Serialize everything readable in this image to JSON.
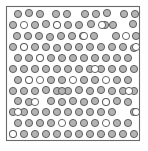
{
  "figure": {
    "width": 148,
    "height": 151,
    "background_color": "#ffffff"
  },
  "frame": {
    "name": "bounding-box",
    "x": 6.5,
    "y": 6.5,
    "width": 133,
    "height": 134,
    "stroke_color": "#6b6b6b",
    "fill_color": "#ffffff",
    "stroke_width": 1.1
  },
  "legend": {
    "filled_label": "filled particle",
    "open_label": "open particle",
    "filled_color": "#b3b3b3",
    "open_color": "#ffffff",
    "outline_color": "#4a4a4a"
  },
  "chart_data": {
    "type": "scatter",
    "title": "",
    "xlabel": "",
    "ylabel": "",
    "xlim": [
      6.5,
      139.5
    ],
    "ylim": [
      6.5,
      140.5
    ],
    "grid": false,
    "legend_position": "none",
    "radius": 3.6,
    "counts": {
      "total": 148,
      "filled": 127,
      "open": 21
    },
    "series": [
      {
        "name": "filled",
        "fill": "#b3b3b3",
        "stroke": "#4a4a4a",
        "points": [
          [
            18,
            14
          ],
          [
            29,
            13
          ],
          [
            40,
            14
          ],
          [
            56,
            14
          ],
          [
            67,
            14
          ],
          [
            85,
            14
          ],
          [
            96,
            14
          ],
          [
            107,
            13
          ],
          [
            124,
            14
          ],
          [
            135,
            14
          ],
          [
            13,
            25
          ],
          [
            35,
            25
          ],
          [
            46,
            24
          ],
          [
            68,
            25
          ],
          [
            79,
            25
          ],
          [
            91,
            24
          ],
          [
            113,
            25
          ],
          [
            133,
            24
          ],
          [
            17,
            36
          ],
          [
            28,
            36
          ],
          [
            39,
            36
          ],
          [
            50,
            37
          ],
          [
            61,
            36
          ],
          [
            72,
            36
          ],
          [
            83,
            36
          ],
          [
            94,
            36
          ],
          [
            116,
            36
          ],
          [
            136,
            36
          ],
          [
            13,
            47
          ],
          [
            35,
            47
          ],
          [
            46,
            47
          ],
          [
            57,
            48
          ],
          [
            68,
            47
          ],
          [
            79,
            47
          ],
          [
            90,
            47
          ],
          [
            101,
            47
          ],
          [
            112,
            47
          ],
          [
            123,
            47
          ],
          [
            134,
            48
          ],
          [
            18,
            58
          ],
          [
            29,
            58
          ],
          [
            51,
            58
          ],
          [
            62,
            58
          ],
          [
            73,
            58
          ],
          [
            84,
            58
          ],
          [
            95,
            58
          ],
          [
            106,
            58
          ],
          [
            117,
            58
          ],
          [
            128,
            58
          ],
          [
            13,
            69
          ],
          [
            24,
            69
          ],
          [
            35,
            69
          ],
          [
            46,
            69
          ],
          [
            57,
            69
          ],
          [
            68,
            69
          ],
          [
            79,
            69
          ],
          [
            90,
            69
          ],
          [
            101,
            69
          ],
          [
            112,
            69
          ],
          [
            123,
            69
          ],
          [
            134,
            69
          ],
          [
            18,
            80
          ],
          [
            29,
            80
          ],
          [
            51,
            80
          ],
          [
            62,
            80
          ],
          [
            84,
            80
          ],
          [
            95,
            80
          ],
          [
            117,
            80
          ],
          [
            128,
            80
          ],
          [
            13,
            91
          ],
          [
            24,
            91
          ],
          [
            35,
            91
          ],
          [
            46,
            90
          ],
          [
            57,
            91
          ],
          [
            68,
            91
          ],
          [
            79,
            90
          ],
          [
            90,
            91
          ],
          [
            101,
            90
          ],
          [
            112,
            91
          ],
          [
            123,
            91
          ],
          [
            134,
            91
          ],
          [
            18,
            101
          ],
          [
            29,
            102
          ],
          [
            51,
            101
          ],
          [
            62,
            102
          ],
          [
            73,
            101
          ],
          [
            84,
            102
          ],
          [
            95,
            101
          ],
          [
            117,
            101
          ],
          [
            128,
            102
          ],
          [
            13,
            112
          ],
          [
            24,
            112
          ],
          [
            35,
            112
          ],
          [
            46,
            112
          ],
          [
            57,
            112
          ],
          [
            68,
            112
          ],
          [
            79,
            112
          ],
          [
            90,
            112
          ],
          [
            101,
            112
          ],
          [
            112,
            112
          ],
          [
            134,
            112
          ],
          [
            18,
            123
          ],
          [
            29,
            123
          ],
          [
            40,
            123
          ],
          [
            51,
            123
          ],
          [
            73,
            123
          ],
          [
            84,
            123
          ],
          [
            95,
            123
          ],
          [
            117,
            123
          ],
          [
            128,
            123
          ],
          [
            24,
            134
          ],
          [
            35,
            134
          ],
          [
            46,
            134
          ],
          [
            57,
            134
          ],
          [
            68,
            134
          ],
          [
            79,
            134
          ],
          [
            90,
            134
          ],
          [
            101,
            134
          ],
          [
            112,
            134
          ],
          [
            123,
            134
          ],
          [
            134,
            134
          ],
          [
            105,
            25
          ],
          [
            57,
            25
          ],
          [
            24,
            47
          ],
          [
            40,
            58
          ],
          [
            106,
            102
          ],
          [
            62,
            91
          ],
          [
            13,
            134
          ]
        ]
      },
      {
        "name": "open",
        "fill": "#ffffff",
        "stroke": "#4a4a4a",
        "points": [
          [
            24,
            25
          ],
          [
            57,
            25
          ],
          [
            102,
            25
          ],
          [
            126,
            36
          ],
          [
            24,
            47
          ],
          [
            40,
            58
          ],
          [
            136,
            47
          ],
          [
            29,
            80
          ],
          [
            40,
            80
          ],
          [
            73,
            80
          ],
          [
            106,
            80
          ],
          [
            35,
            102
          ],
          [
            106,
            102
          ],
          [
            136,
            112
          ],
          [
            62,
            123
          ],
          [
            106,
            123
          ],
          [
            13,
            134
          ],
          [
            129,
            91
          ],
          [
            95,
            69
          ],
          [
            84,
            36
          ],
          [
            18,
            112
          ]
        ]
      }
    ]
  }
}
